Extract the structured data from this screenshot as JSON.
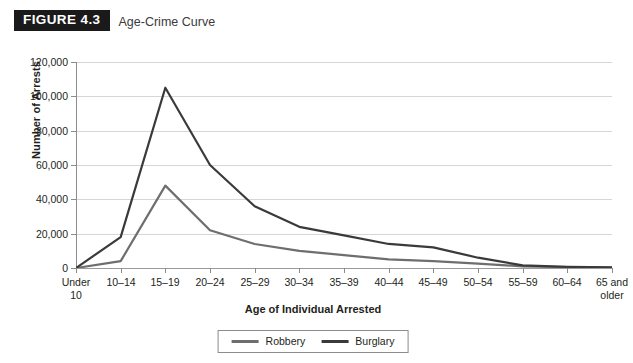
{
  "figure": {
    "badge": "FIGURE 4.3",
    "caption": "Age-Crime Curve"
  },
  "chart_data": {
    "type": "line",
    "title": "Age-Crime Curve",
    "xlabel": "Age of Individual Arrested",
    "ylabel": "Number of Arrests",
    "categories": [
      "Under 10",
      "10–14",
      "15–19",
      "20–24",
      "25–29",
      "30–34",
      "35–39",
      "40–44",
      "45–49",
      "50–54",
      "55–59",
      "60–64",
      "65 and older"
    ],
    "yticks": [
      0,
      20000,
      40000,
      60000,
      80000,
      100000,
      120000
    ],
    "ytick_labels": [
      "0",
      "20,000",
      "40,000",
      "60,000",
      "80,000",
      "100,000",
      "120,000"
    ],
    "ylim": [
      0,
      120000
    ],
    "grid": "horizontal",
    "legend_position": "bottom-center",
    "series": [
      {
        "name": "Robbery",
        "color": "#6e6e6e",
        "values": [
          0,
          4000,
          48000,
          22000,
          14000,
          10000,
          7500,
          5000,
          4000,
          2500,
          1000,
          500,
          300
        ]
      },
      {
        "name": "Burglary",
        "color": "#3a3a3a",
        "values": [
          0,
          18000,
          105000,
          60000,
          36000,
          24000,
          19000,
          14000,
          12000,
          6000,
          1500,
          700,
          400
        ]
      }
    ]
  },
  "colors": {
    "grid": "#d6d6d6",
    "axis": "#8c8c8c",
    "badge_bg": "#1a1a1a",
    "text": "#231f20"
  }
}
